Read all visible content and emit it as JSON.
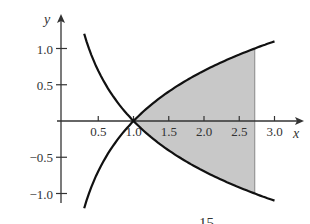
{
  "chart_data": {
    "type": "line",
    "title": "",
    "xlabel": "x",
    "ylabel": "y",
    "xlim": [
      0,
      3.3
    ],
    "ylim": [
      -1.2,
      1.3
    ],
    "x_ticks": [
      "0.5",
      "1.0",
      "1.5",
      "2.0",
      "2.5",
      "3.0"
    ],
    "y_ticks": [
      "1.0",
      "0.5",
      "−0.5",
      "−1.0"
    ],
    "grid": false,
    "legend": null,
    "series": [
      {
        "name": "y = ln x",
        "x": [
          0.3,
          0.5,
          0.75,
          1.0,
          1.5,
          2.0,
          2.5,
          3.0
        ],
        "values": [
          -1.2,
          -0.69,
          -0.29,
          0.0,
          0.41,
          0.69,
          0.92,
          1.1
        ]
      },
      {
        "name": "y = -ln x",
        "x": [
          0.3,
          0.5,
          0.75,
          1.0,
          1.5,
          2.0,
          2.5,
          3.0
        ],
        "values": [
          1.2,
          0.69,
          0.29,
          0.0,
          -0.41,
          -0.69,
          -0.92,
          -1.1
        ]
      }
    ],
    "shaded_region": {
      "description": "region between the two curves",
      "x_from": 1.0,
      "x_to": 2.72,
      "fill": "#c8c8c8"
    },
    "annotations": [
      "15"
    ]
  },
  "colors": {
    "curve": "#111111",
    "axis": "#333333",
    "shade": "#c8c8c8"
  }
}
